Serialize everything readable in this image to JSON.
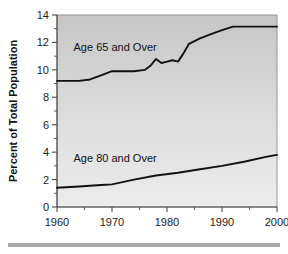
{
  "figure": {
    "background_color": "#ffffff",
    "plot_background_top_color": "#c6c6c6",
    "plot_background_bottom_color": "#ebebeb",
    "line_color": "#111111",
    "axis_color": "#4a4a4a",
    "footer_rule_color": "#a8a8a8"
  },
  "chart_data": {
    "type": "line",
    "title": "",
    "xlabel": "",
    "ylabel": "Percent of Total Population",
    "xlim": [
      1960,
      2000
    ],
    "ylim": [
      0,
      14
    ],
    "grid": false,
    "legend_position": "inline-annotation",
    "xticks": [
      1960,
      1970,
      1980,
      1990,
      2000
    ],
    "xtick_labels": [
      "1960",
      "1970",
      "1980",
      "1990",
      "2000"
    ],
    "x_minor_ticks": [
      1965,
      1975,
      1985,
      1995
    ],
    "yticks": [
      0,
      2,
      4,
      6,
      8,
      10,
      12,
      14
    ],
    "ytick_labels": [
      "0",
      "2",
      "4",
      "6",
      "8",
      "10",
      "12",
      "14"
    ],
    "y_minor_ticks": [
      1,
      3,
      5,
      7,
      9,
      11,
      13
    ],
    "annotations": [
      {
        "text": "Age 65 and Over",
        "x": 1963.0,
        "y": 11.4
      },
      {
        "text": "Age 80 and Over",
        "x": 1963.0,
        "y": 3.3
      }
    ],
    "series": [
      {
        "name": "Age 65 and Over",
        "label": "Age 65 and Over",
        "color": "#111111",
        "x": [
          1960,
          1962,
          1964,
          1966,
          1968,
          1970,
          1972,
          1974,
          1976,
          1977,
          1978,
          1979,
          1980,
          1981,
          1982,
          1983,
          1984,
          1986,
          1988,
          1990,
          1992,
          1994,
          1996,
          1998,
          2000
        ],
        "values": [
          9.2,
          9.2,
          9.2,
          9.3,
          9.6,
          9.9,
          9.9,
          9.9,
          10.0,
          10.3,
          10.8,
          10.5,
          10.6,
          10.7,
          10.6,
          11.2,
          11.9,
          12.3,
          12.6,
          12.9,
          13.15,
          13.15,
          13.15,
          13.15,
          13.15
        ]
      },
      {
        "name": "Age 80 and Over",
        "label": "Age 80 and Over",
        "color": "#111111",
        "x": [
          1960,
          1964,
          1968,
          1970,
          1974,
          1978,
          1982,
          1986,
          1990,
          1994,
          1998,
          2000
        ],
        "values": [
          1.4,
          1.5,
          1.6,
          1.65,
          2.0,
          2.3,
          2.5,
          2.75,
          3.0,
          3.3,
          3.65,
          3.8
        ]
      }
    ]
  }
}
